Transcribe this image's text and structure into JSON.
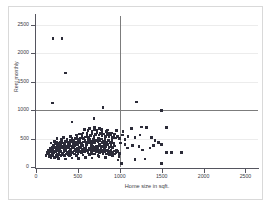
{
  "chart_data": {
    "type": "scatter",
    "title": "",
    "xlabel": "Home size in sqft.",
    "ylabel": "Rent monthly",
    "xlim": [
      0,
      2650
    ],
    "ylim": [
      0,
      2650
    ],
    "xticks": [
      0,
      500,
      1000,
      1500,
      2000,
      2500
    ],
    "yticks": [
      0,
      500,
      1000,
      1500,
      2000,
      2500
    ],
    "xtick_labels": [
      "0",
      "500",
      "1000",
      "1500",
      "2000",
      "2500"
    ],
    "ytick_labels": [
      "0",
      "500",
      "1000",
      "1500",
      "2000",
      "2500"
    ],
    "grid": "horizontal",
    "legend": "none",
    "marker_color": "#2b2b38",
    "marker_shape": "square",
    "marker_size": 2.6,
    "gridline_color": "#ececec",
    "axis_color": "#55555f",
    "frame_color": "#d9d9d9",
    "background_color": "#ffffff",
    "reference_lines": [
      {
        "orientation": "vertical",
        "value": 1000,
        "color": "#7c7c7c"
      },
      {
        "orientation": "horizontal",
        "value": 1000,
        "color": "#7c7c7c"
      }
    ],
    "points": [
      [
        205,
        2250
      ],
      [
        310,
        2250
      ],
      [
        350,
        1650
      ],
      [
        195,
        1120
      ],
      [
        800,
        1040
      ],
      [
        1200,
        1140
      ],
      [
        1500,
        990
      ],
      [
        430,
        790
      ],
      [
        690,
        850
      ],
      [
        700,
        700
      ],
      [
        780,
        660
      ],
      [
        1140,
        680
      ],
      [
        1260,
        700
      ],
      [
        1320,
        690
      ],
      [
        1560,
        690
      ],
      [
        1040,
        620
      ],
      [
        960,
        640
      ],
      [
        900,
        600
      ],
      [
        840,
        620
      ],
      [
        620,
        640
      ],
      [
        560,
        600
      ],
      [
        520,
        580
      ],
      [
        480,
        560
      ],
      [
        1030,
        560
      ],
      [
        1100,
        540
      ],
      [
        1180,
        520
      ],
      [
        1240,
        560
      ],
      [
        1380,
        520
      ],
      [
        1420,
        470
      ],
      [
        1460,
        430
      ],
      [
        1500,
        400
      ],
      [
        1560,
        250
      ],
      [
        1620,
        250
      ],
      [
        1740,
        250
      ],
      [
        1500,
        60
      ],
      [
        1020,
        60
      ],
      [
        980,
        120
      ],
      [
        1180,
        130
      ],
      [
        1300,
        140
      ],
      [
        1360,
        330
      ],
      [
        1400,
        380
      ],
      [
        1270,
        300
      ],
      [
        1230,
        360
      ],
      [
        1150,
        380
      ],
      [
        1090,
        330
      ],
      [
        1060,
        400
      ],
      [
        1010,
        420
      ],
      [
        960,
        300
      ],
      [
        930,
        380
      ],
      [
        900,
        420
      ],
      [
        870,
        330
      ],
      [
        840,
        400
      ],
      [
        810,
        350
      ],
      [
        790,
        430
      ],
      [
        760,
        390
      ],
      [
        740,
        450
      ],
      [
        720,
        370
      ],
      [
        700,
        420
      ],
      [
        680,
        460
      ],
      [
        660,
        390
      ],
      [
        640,
        430
      ],
      [
        620,
        470
      ],
      [
        600,
        400
      ],
      [
        580,
        440
      ],
      [
        560,
        380
      ],
      [
        540,
        420
      ],
      [
        520,
        460
      ],
      [
        500,
        390
      ],
      [
        480,
        430
      ],
      [
        460,
        370
      ],
      [
        440,
        410
      ],
      [
        420,
        450
      ],
      [
        400,
        380
      ],
      [
        380,
        420
      ],
      [
        360,
        360
      ],
      [
        340,
        400
      ],
      [
        320,
        340
      ],
      [
        300,
        380
      ],
      [
        280,
        320
      ],
      [
        260,
        360
      ],
      [
        240,
        300
      ],
      [
        220,
        340
      ],
      [
        200,
        280
      ],
      [
        180,
        310
      ],
      [
        160,
        260
      ],
      [
        150,
        290
      ],
      [
        140,
        230
      ],
      [
        130,
        250
      ],
      [
        120,
        200
      ],
      [
        175,
        200
      ],
      [
        195,
        230
      ],
      [
        215,
        250
      ],
      [
        235,
        270
      ],
      [
        255,
        290
      ],
      [
        275,
        310
      ],
      [
        295,
        330
      ],
      [
        315,
        350
      ],
      [
        335,
        300
      ],
      [
        355,
        320
      ],
      [
        375,
        340
      ],
      [
        395,
        360
      ],
      [
        415,
        310
      ],
      [
        435,
        330
      ],
      [
        455,
        350
      ],
      [
        475,
        300
      ],
      [
        495,
        320
      ],
      [
        515,
        340
      ],
      [
        535,
        360
      ],
      [
        555,
        310
      ],
      [
        575,
        330
      ],
      [
        595,
        350
      ],
      [
        615,
        300
      ],
      [
        635,
        320
      ],
      [
        655,
        340
      ],
      [
        675,
        360
      ],
      [
        695,
        310
      ],
      [
        715,
        330
      ],
      [
        735,
        350
      ],
      [
        755,
        300
      ],
      [
        775,
        320
      ],
      [
        795,
        290
      ],
      [
        815,
        310
      ],
      [
        835,
        280
      ],
      [
        855,
        300
      ],
      [
        875,
        270
      ],
      [
        895,
        290
      ],
      [
        915,
        260
      ],
      [
        935,
        280
      ],
      [
        955,
        250
      ],
      [
        975,
        270
      ],
      [
        995,
        240
      ],
      [
        190,
        350
      ],
      [
        210,
        380
      ],
      [
        230,
        410
      ],
      [
        250,
        440
      ],
      [
        270,
        400
      ],
      [
        290,
        430
      ],
      [
        310,
        460
      ],
      [
        330,
        420
      ],
      [
        350,
        450
      ],
      [
        370,
        480
      ],
      [
        390,
        440
      ],
      [
        410,
        470
      ],
      [
        430,
        500
      ],
      [
        450,
        460
      ],
      [
        470,
        490
      ],
      [
        490,
        520
      ],
      [
        510,
        480
      ],
      [
        530,
        510
      ],
      [
        550,
        540
      ],
      [
        570,
        500
      ],
      [
        590,
        530
      ],
      [
        610,
        560
      ],
      [
        630,
        520
      ],
      [
        650,
        550
      ],
      [
        670,
        580
      ],
      [
        690,
        540
      ],
      [
        710,
        570
      ],
      [
        730,
        600
      ],
      [
        750,
        560
      ],
      [
        770,
        590
      ],
      [
        790,
        550
      ],
      [
        810,
        580
      ],
      [
        830,
        540
      ],
      [
        850,
        570
      ],
      [
        870,
        530
      ],
      [
        890,
        560
      ],
      [
        910,
        520
      ],
      [
        930,
        550
      ],
      [
        950,
        510
      ],
      [
        970,
        540
      ],
      [
        160,
        180
      ],
      [
        180,
        160
      ],
      [
        200,
        190
      ],
      [
        220,
        170
      ],
      [
        240,
        200
      ],
      [
        260,
        180
      ],
      [
        280,
        210
      ],
      [
        300,
        190
      ],
      [
        320,
        220
      ],
      [
        340,
        200
      ],
      [
        360,
        230
      ],
      [
        380,
        210
      ],
      [
        400,
        240
      ],
      [
        420,
        220
      ],
      [
        440,
        250
      ],
      [
        460,
        230
      ],
      [
        480,
        260
      ],
      [
        500,
        240
      ],
      [
        520,
        270
      ],
      [
        540,
        250
      ],
      [
        560,
        280
      ],
      [
        580,
        260
      ],
      [
        600,
        290
      ],
      [
        620,
        270
      ],
      [
        640,
        300
      ],
      [
        660,
        280
      ],
      [
        680,
        310
      ],
      [
        700,
        290
      ],
      [
        720,
        260
      ],
      [
        740,
        290
      ],
      [
        760,
        250
      ],
      [
        780,
        270
      ],
      [
        800,
        240
      ],
      [
        820,
        260
      ],
      [
        840,
        230
      ],
      [
        860,
        250
      ],
      [
        880,
        220
      ],
      [
        900,
        240
      ],
      [
        920,
        210
      ],
      [
        940,
        230
      ],
      [
        145,
        300
      ],
      [
        165,
        330
      ],
      [
        185,
        290
      ],
      [
        205,
        320
      ],
      [
        225,
        350
      ],
      [
        245,
        310
      ],
      [
        265,
        340
      ],
      [
        285,
        370
      ],
      [
        305,
        330
      ],
      [
        325,
        360
      ],
      [
        345,
        390
      ],
      [
        365,
        350
      ],
      [
        385,
        380
      ],
      [
        405,
        410
      ],
      [
        425,
        370
      ],
      [
        445,
        400
      ],
      [
        465,
        430
      ],
      [
        485,
        390
      ],
      [
        505,
        420
      ],
      [
        525,
        450
      ],
      [
        545,
        410
      ],
      [
        565,
        440
      ],
      [
        585,
        470
      ],
      [
        605,
        430
      ],
      [
        625,
        460
      ],
      [
        645,
        490
      ],
      [
        665,
        450
      ],
      [
        685,
        480
      ],
      [
        705,
        440
      ],
      [
        725,
        470
      ],
      [
        745,
        500
      ],
      [
        765,
        460
      ],
      [
        785,
        490
      ],
      [
        805,
        450
      ],
      [
        825,
        480
      ],
      [
        845,
        440
      ],
      [
        865,
        470
      ],
      [
        885,
        430
      ],
      [
        905,
        460
      ],
      [
        925,
        420
      ],
      [
        155,
        240
      ],
      [
        175,
        270
      ],
      [
        195,
        250
      ],
      [
        215,
        280
      ],
      [
        235,
        260
      ],
      [
        255,
        230
      ],
      [
        275,
        250
      ],
      [
        295,
        270
      ],
      [
        315,
        240
      ],
      [
        335,
        260
      ],
      [
        355,
        280
      ],
      [
        375,
        250
      ],
      [
        395,
        270
      ],
      [
        415,
        290
      ],
      [
        435,
        260
      ],
      [
        455,
        280
      ],
      [
        475,
        310
      ],
      [
        495,
        280
      ],
      [
        515,
        300
      ],
      [
        535,
        330
      ],
      [
        555,
        290
      ],
      [
        575,
        310
      ],
      [
        595,
        340
      ],
      [
        615,
        300
      ],
      [
        635,
        330
      ],
      [
        655,
        360
      ],
      [
        675,
        320
      ],
      [
        695,
        350
      ],
      [
        715,
        310
      ],
      [
        735,
        340
      ],
      [
        755,
        370
      ],
      [
        775,
        330
      ],
      [
        795,
        360
      ],
      [
        815,
        400
      ],
      [
        835,
        360
      ],
      [
        855,
        390
      ],
      [
        875,
        350
      ],
      [
        895,
        380
      ],
      [
        915,
        340
      ],
      [
        935,
        370
      ],
      [
        250,
        500
      ],
      [
        330,
        520
      ],
      [
        410,
        540
      ],
      [
        470,
        510
      ],
      [
        550,
        570
      ],
      [
        610,
        600
      ],
      [
        670,
        620
      ],
      [
        730,
        640
      ],
      [
        790,
        610
      ],
      [
        850,
        650
      ],
      [
        270,
        150
      ],
      [
        350,
        140
      ],
      [
        430,
        160
      ],
      [
        510,
        150
      ],
      [
        590,
        170
      ],
      [
        670,
        160
      ],
      [
        750,
        180
      ],
      [
        830,
        170
      ],
      [
        910,
        190
      ],
      [
        990,
        180
      ],
      [
        640,
        680
      ],
      [
        580,
        660
      ],
      [
        700,
        660
      ],
      [
        760,
        680
      ],
      [
        880,
        600
      ],
      [
        940,
        580
      ],
      [
        1000,
        500
      ],
      [
        1060,
        480
      ],
      [
        640,
        220
      ],
      [
        560,
        210
      ],
      [
        480,
        200
      ],
      [
        400,
        190
      ],
      [
        300,
        480
      ],
      [
        260,
        420
      ],
      [
        220,
        450
      ],
      [
        180,
        420
      ],
      [
        740,
        200
      ],
      [
        700,
        230
      ],
      [
        660,
        240
      ],
      [
        620,
        250
      ]
    ]
  }
}
